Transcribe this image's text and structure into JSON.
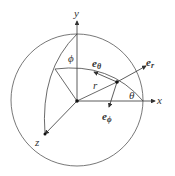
{
  "diagram": {
    "axes": {
      "x": "x",
      "y": "y",
      "z": "z"
    },
    "radius_label": "r",
    "angles": {
      "phi": "ϕ",
      "theta": "θ"
    },
    "vectors": {
      "e_r": {
        "base": "e",
        "sub": "r"
      },
      "e_theta": {
        "base": "e",
        "sub": "θ"
      },
      "e_phi": {
        "base": "e",
        "sub": "ϕ"
      }
    },
    "colors": {
      "line": "#444444",
      "background": "#ffffff"
    }
  }
}
